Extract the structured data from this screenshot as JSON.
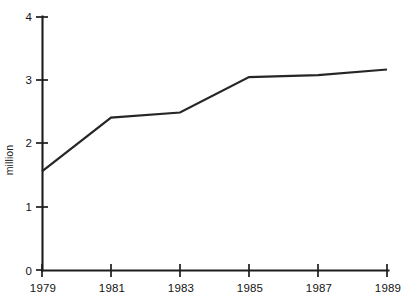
{
  "chart_data": {
    "type": "line",
    "title": "",
    "xlabel": "",
    "ylabel": "million",
    "x": [
      1979,
      1981,
      1983,
      1985,
      1987,
      1989
    ],
    "categories": [
      "1979",
      "1981",
      "1983",
      "1985",
      "1987",
      "1989"
    ],
    "values": [
      1.56,
      2.41,
      2.49,
      3.05,
      3.08,
      3.17
    ],
    "series": [
      {
        "name": "",
        "values": [
          1.56,
          2.41,
          2.49,
          3.05,
          3.08,
          3.17
        ]
      }
    ],
    "xlim": [
      1979,
      1989
    ],
    "ylim": [
      0,
      4
    ],
    "yticks": [
      0,
      1,
      2,
      3,
      4
    ],
    "ytick_labels": [
      "0",
      "1",
      "2",
      "3",
      "4"
    ],
    "xticks": [
      1979,
      1981,
      1983,
      1985,
      1987,
      1989
    ],
    "xtick_labels": [
      "1979",
      "1981",
      "1983",
      "1985",
      "1987",
      "1989"
    ],
    "grid": false,
    "legend": "none",
    "line_color": "#262626",
    "axis_color": "#1c1c1c",
    "background_color": "#ffffff"
  },
  "axes": {
    "y_title": "million",
    "y_tick_0": "0",
    "y_tick_1": "1",
    "y_tick_2": "2",
    "y_tick_3": "3",
    "y_tick_4": "4",
    "x_tick_0": "1979",
    "x_tick_1": "1981",
    "x_tick_2": "1983",
    "x_tick_3": "1985",
    "x_tick_4": "1987",
    "x_tick_5": "1989"
  }
}
